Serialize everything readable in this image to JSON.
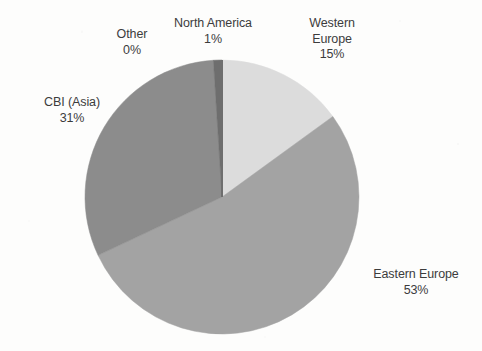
{
  "chart_data": {
    "type": "pie",
    "title": "",
    "subtitle": "",
    "xlabel": "",
    "ylabel": "",
    "legend_position": "none",
    "grid": false,
    "labels_show_percent": true,
    "start_angle_deg": 0,
    "direction": "clockwise",
    "categories": [
      "Western Europe",
      "Eastern Europe",
      "CBI (Asia)",
      "North America",
      "Other"
    ],
    "values": [
      15,
      53,
      31,
      1,
      0
    ],
    "unit": "%",
    "slices": [
      {
        "name": "Western Europe",
        "label_line1": "Western",
        "label_line2": "Europe",
        "percent_text": "15%",
        "value": 15,
        "color": "#dcdcdc",
        "start_deg": 0,
        "end_deg": 54
      },
      {
        "name": "Eastern Europe",
        "label_line1": "Eastern Europe",
        "label_line2": "",
        "percent_text": "53%",
        "value": 53,
        "color": "#a3a3a3",
        "start_deg": 54,
        "end_deg": 244.8
      },
      {
        "name": "CBI (Asia)",
        "label_line1": "CBI (Asia)",
        "label_line2": "",
        "percent_text": "31%",
        "value": 31,
        "color": "#8c8c8c",
        "start_deg": 244.8,
        "end_deg": 356.4
      },
      {
        "name": "North America",
        "label_line1": "North America",
        "label_line2": "",
        "percent_text": "1%",
        "value": 1,
        "color": "#6e6e6e",
        "start_deg": 356.4,
        "end_deg": 360
      },
      {
        "name": "Other",
        "label_line1": "Other",
        "label_line2": "",
        "percent_text": "0%",
        "value": 0,
        "color": "#6e6e6e",
        "start_deg": 360,
        "end_deg": 360
      }
    ]
  },
  "colors": {
    "background": "#fdfdfc",
    "label_text": "#3c3c3c",
    "western_europe": "#dcdcdc",
    "eastern_europe": "#a3a3a3",
    "cbi_asia": "#8c8c8c",
    "north_america": "#6e6e6e"
  }
}
